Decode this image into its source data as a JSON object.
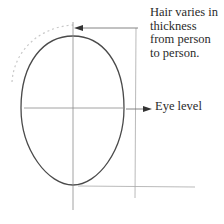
{
  "diagram": {
    "annotations": {
      "hair_note": {
        "lines": [
          "Hair varies in",
          "thickness",
          "from person",
          "to person."
        ]
      },
      "eye_level": "Eye level"
    },
    "colors": {
      "outline": "#4a4a4a",
      "guide": "#9a9a9a",
      "hair": "#c4c4c4",
      "text": "#2a2a2a"
    }
  }
}
